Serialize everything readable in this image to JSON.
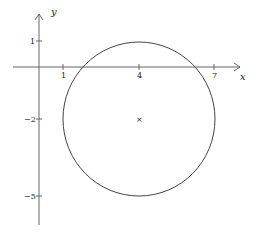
{
  "diagram": {
    "type": "coordinate-plane-circle",
    "axes": {
      "x_label": "x",
      "y_label": "y",
      "x_ticks": [
        {
          "value": 1,
          "label": "1"
        },
        {
          "value": 4,
          "label": "4"
        },
        {
          "value": 7,
          "label": "7"
        }
      ],
      "y_ticks": [
        {
          "value": 1,
          "label": "1"
        },
        {
          "value": -2,
          "label": "−2"
        },
        {
          "value": -5,
          "label": "−5"
        }
      ]
    },
    "circle": {
      "center": [
        4,
        -2
      ],
      "radius": 3,
      "center_marker": "×"
    },
    "colors": {
      "axis": "#555555",
      "circle": "#444444",
      "text": "#222222"
    }
  }
}
